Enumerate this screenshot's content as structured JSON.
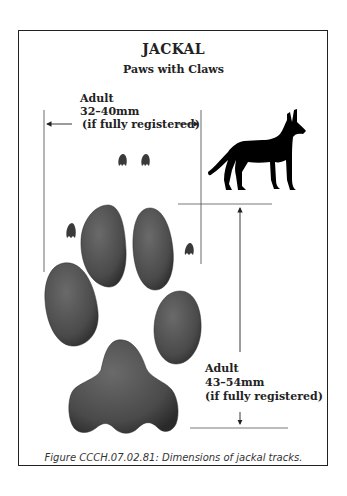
{
  "figure": {
    "title": "JACKAL",
    "subtitle": "Paws with Claws",
    "width_dimension": {
      "line1": "Adult",
      "line2": "32–40mm",
      "line3": "(if fully registered)"
    },
    "length_dimension": {
      "line1": "Adult",
      "line2": "43–54mm",
      "line3": "(if fully registered)"
    },
    "caption": "Figure CCCH.07.02.81:  Dimensions of jackal tracks.",
    "colors": {
      "pad": "#4a4a4a",
      "silhouette": "#000000",
      "lines": "#333333"
    }
  }
}
